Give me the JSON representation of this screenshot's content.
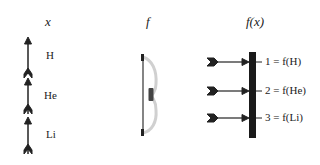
{
  "columns": {
    "x": {
      "header": "x",
      "labels": [
        "H",
        "He",
        "Li"
      ]
    },
    "f": {
      "header": "f"
    },
    "fx": {
      "header": "f(x)",
      "labels": [
        "1 = f(H)",
        "2 = f(He)",
        "3 = f(Li)"
      ]
    }
  },
  "colors": {
    "ink": "#222222",
    "bow": "#c8c8c8",
    "target": "#1a1a1a"
  }
}
